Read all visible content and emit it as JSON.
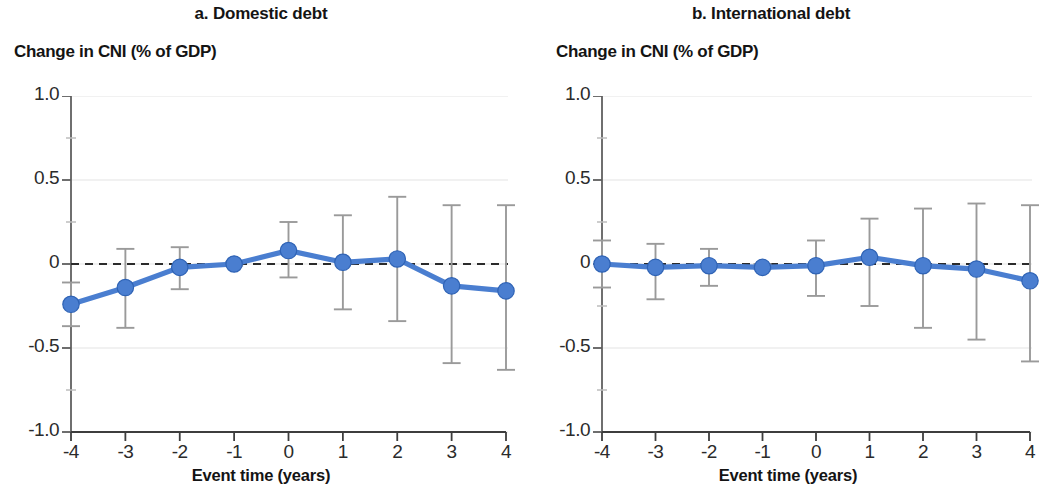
{
  "figure": {
    "background": "#ffffff",
    "accent_color": "#4a7ed0",
    "errorbar_color": "#9a9a9a",
    "zero_line_color": "#2b2b2b",
    "grid_color": "#ededed"
  },
  "panels": [
    {
      "key": "a",
      "title": "a. Domestic debt",
      "axis_title": "Change in CNI (% of GDP)",
      "xlabel": "Event time (years)"
    },
    {
      "key": "b",
      "title": "b. International debt",
      "axis_title": "Change in CNI (% of GDP)",
      "xlabel": "Event time (years)"
    }
  ],
  "chart_data": [
    {
      "type": "line",
      "panel": "a",
      "title": "a. Domestic debt",
      "subtitle": "Change in CNI (% of GDP)",
      "xlabel": "Event time (years)",
      "ylabel": "Change in CNI (% of GDP)",
      "x": [
        -4,
        -3,
        -2,
        -1,
        0,
        1,
        2,
        3,
        4
      ],
      "xticklabels": [
        "-4",
        "-3",
        "-2",
        "-1",
        "0",
        "1",
        "2",
        "3",
        "4"
      ],
      "yticks": [
        1.0,
        0.5,
        0,
        -0.5,
        -1.0
      ],
      "yticklabels": [
        "1.0",
        "0.5",
        "0",
        "-0.5",
        "-1.0"
      ],
      "xlim": [
        -4,
        4
      ],
      "ylim": [
        -1.0,
        1.0
      ],
      "grid": true,
      "legend": "none",
      "zero_reference_line": 0,
      "series": [
        {
          "name": "Change in CNI (% of GDP), domestic debt",
          "values": [
            -0.24,
            -0.14,
            -0.02,
            0.0,
            0.08,
            0.01,
            0.03,
            -0.13,
            -0.16
          ],
          "ci_lower": [
            -0.37,
            -0.38,
            -0.15,
            -0.01,
            -0.08,
            -0.27,
            -0.34,
            -0.59,
            -0.63
          ],
          "ci_upper": [
            -0.11,
            0.09,
            0.1,
            0.01,
            0.25,
            0.29,
            0.4,
            0.35,
            0.35
          ]
        }
      ]
    },
    {
      "type": "line",
      "panel": "b",
      "title": "b. International debt",
      "subtitle": "Change in CNI (% of GDP)",
      "xlabel": "Event time (years)",
      "ylabel": "Change in CNI (% of GDP)",
      "x": [
        -4,
        -3,
        -2,
        -1,
        0,
        1,
        2,
        3,
        4
      ],
      "xticklabels": [
        "-4",
        "-3",
        "-2",
        "-1",
        "0",
        "1",
        "2",
        "3",
        "4"
      ],
      "yticks": [
        1.0,
        0.5,
        0,
        -0.5,
        -1.0
      ],
      "yticklabels": [
        "1.0",
        "0.5",
        "0",
        "-0.5",
        "-1.0"
      ],
      "xlim": [
        -4,
        4
      ],
      "ylim": [
        -1.0,
        1.0
      ],
      "grid": true,
      "legend": "none",
      "zero_reference_line": 0,
      "series": [
        {
          "name": "Change in CNI (% of GDP), international debt",
          "values": [
            0.0,
            -0.02,
            -0.01,
            -0.02,
            -0.01,
            0.04,
            -0.01,
            -0.03,
            -0.1
          ],
          "ci_lower": [
            -0.14,
            -0.21,
            -0.13,
            -0.03,
            -0.19,
            -0.25,
            -0.38,
            -0.45,
            -0.58
          ],
          "ci_upper": [
            0.14,
            0.12,
            0.09,
            0.0,
            0.14,
            0.27,
            0.33,
            0.36,
            0.35
          ]
        }
      ]
    }
  ]
}
